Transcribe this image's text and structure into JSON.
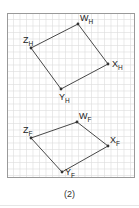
{
  "figure": {
    "caption": "(2)",
    "colors": {
      "frame": "#9a9a9a",
      "grid": "#dcdcdc",
      "edge": "#333333",
      "label": "#222222"
    },
    "frame": {
      "x": 7,
      "y": 13,
      "width": 127,
      "height": 164,
      "grid_spacing": 6.5
    },
    "shapes": [
      {
        "name": "H",
        "vertices": [
          {
            "id": "W",
            "sub": "H",
            "x": 78,
            "y": 24,
            "label_dx": 2,
            "label_dy": -3
          },
          {
            "id": "X",
            "sub": "H",
            "x": 108,
            "y": 64,
            "label_dx": 4,
            "label_dy": 3
          },
          {
            "id": "Y",
            "sub": "H",
            "x": 61,
            "y": 89,
            "label_dx": -2,
            "label_dy": 11
          },
          {
            "id": "Z",
            "sub": "H",
            "x": 31,
            "y": 48,
            "label_dx": -8,
            "label_dy": -5
          }
        ]
      },
      {
        "name": "F",
        "vertices": [
          {
            "id": "W",
            "sub": "F",
            "x": 77,
            "y": 122,
            "label_dx": 2,
            "label_dy": -3
          },
          {
            "id": "X",
            "sub": "F",
            "x": 108,
            "y": 146,
            "label_dx": 2,
            "label_dy": -3
          },
          {
            "id": "Y",
            "sub": "F",
            "x": 62,
            "y": 172,
            "label_dx": 3,
            "label_dy": 3
          },
          {
            "id": "Z",
            "sub": "F",
            "x": 31,
            "y": 138,
            "label_dx": -8,
            "label_dy": -5
          }
        ]
      }
    ]
  }
}
